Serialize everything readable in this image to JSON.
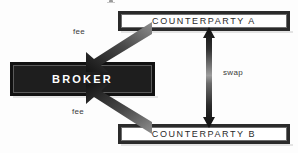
{
  "diagram": {
    "background_color": "#fdfdfd",
    "nodes": {
      "broker": {
        "label": "BROKER",
        "fill_color": "#111111",
        "text_color": "#ffffff"
      },
      "counterparty_a": {
        "label": "COUNTERPARTY A",
        "fill_color": "#ffffff",
        "border_color": "#2b2b2b",
        "text_color": "#2a2a2a"
      },
      "counterparty_b": {
        "label": "COUNTERPARTY B",
        "fill_color": "#ffffff",
        "border_color": "#2b2b2b",
        "text_color": "#2a2a2a"
      }
    },
    "edges": [
      {
        "id": "fee-top",
        "label": "fee",
        "from": "counterparty_a",
        "to": "broker",
        "direction": "single",
        "style": "diagonal-gradient"
      },
      {
        "id": "fee-bottom",
        "label": "fee",
        "from": "counterparty_b",
        "to": "broker",
        "direction": "single",
        "style": "diagonal-gradient"
      },
      {
        "id": "swap",
        "label": "swap",
        "from": "counterparty_a",
        "to": "counterparty_b",
        "direction": "double",
        "style": "vertical-gradient"
      }
    ]
  }
}
